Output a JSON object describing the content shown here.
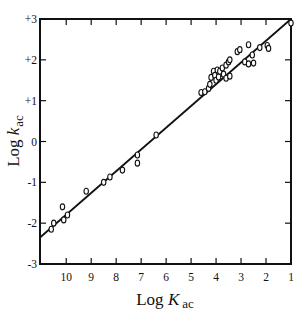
{
  "chart_data": {
    "type": "scatter",
    "title": "",
    "xlabel": "Log K ac",
    "xlabel_parts": {
      "main": "Log ",
      "var": "K",
      "sub": "ac"
    },
    "ylabel": "Log k ac",
    "ylabel_parts": {
      "main": "Log ",
      "var": "k",
      "sub": "ac"
    },
    "xlim": [
      11.05,
      1
    ],
    "ylim": [
      -3,
      3
    ],
    "x_reversed": true,
    "grid": false,
    "legend": null,
    "x_ticks": [
      10,
      9,
      8,
      7,
      6,
      5,
      4,
      3,
      2,
      1
    ],
    "x_tick_labels": [
      "10",
      "9",
      "8",
      "7",
      "6",
      "5",
      "4",
      "3",
      "2",
      "1"
    ],
    "y_ticks": [
      3,
      2,
      1,
      0,
      -1,
      -2,
      -3
    ],
    "y_tick_labels": [
      "+3",
      "+2",
      "+1",
      "0",
      "-1",
      "-2",
      "-3"
    ],
    "marker": "open-circle",
    "fit_line": {
      "x": [
        11.05,
        1.0
      ],
      "y": [
        -2.35,
        3.0
      ]
    },
    "series": [
      {
        "name": "data",
        "points": [
          [
            10.6,
            -2.15
          ],
          [
            10.5,
            -2.0
          ],
          [
            10.15,
            -1.6
          ],
          [
            10.1,
            -1.92
          ],
          [
            9.95,
            -1.8
          ],
          [
            9.2,
            -1.22
          ],
          [
            8.5,
            -1.0
          ],
          [
            8.25,
            -0.87
          ],
          [
            7.75,
            -0.7
          ],
          [
            7.15,
            -0.33
          ],
          [
            7.15,
            -0.53
          ],
          [
            6.4,
            0.16
          ],
          [
            4.6,
            1.2
          ],
          [
            4.45,
            1.22
          ],
          [
            4.3,
            1.3
          ],
          [
            4.25,
            1.4
          ],
          [
            4.2,
            1.57
          ],
          [
            4.1,
            1.72
          ],
          [
            4.05,
            1.62
          ],
          [
            4.0,
            1.5
          ],
          [
            3.95,
            1.75
          ],
          [
            3.9,
            1.58
          ],
          [
            3.85,
            1.72
          ],
          [
            3.75,
            1.8
          ],
          [
            3.7,
            1.65
          ],
          [
            3.6,
            1.87
          ],
          [
            3.6,
            1.55
          ],
          [
            3.5,
            1.95
          ],
          [
            3.45,
            1.6
          ],
          [
            3.45,
            2.0
          ],
          [
            3.15,
            2.2
          ],
          [
            3.05,
            2.25
          ],
          [
            2.85,
            1.95
          ],
          [
            2.7,
            2.37
          ],
          [
            2.7,
            1.9
          ],
          [
            2.55,
            2.12
          ],
          [
            2.5,
            1.92
          ],
          [
            2.25,
            2.3
          ],
          [
            1.95,
            2.35
          ],
          [
            1.9,
            2.28
          ],
          [
            1.0,
            2.9
          ]
        ]
      }
    ]
  }
}
